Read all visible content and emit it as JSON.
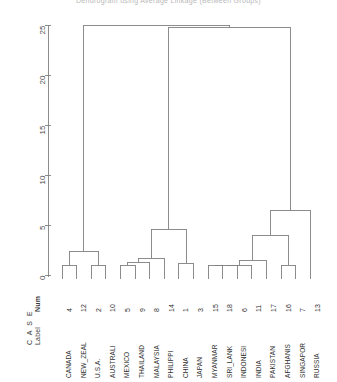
{
  "title": "Dendrogram using Average Linkage (Between Groups)",
  "axis": {
    "ticks": [
      "0",
      "5",
      "10",
      "15",
      "20",
      "25"
    ],
    "min": 0,
    "max": 25
  },
  "headers": {
    "case": "C A S E",
    "label": "Label",
    "num": "Num"
  },
  "leaves": [
    {
      "label": "CANADA",
      "num": "4"
    },
    {
      "label": "NEW_ZEAL",
      "num": "12"
    },
    {
      "label": "U.S.A.",
      "num": "2"
    },
    {
      "label": "AUSTRALI",
      "num": "10"
    },
    {
      "label": "MEXICO",
      "num": "5"
    },
    {
      "label": "THAILAND",
      "num": "9"
    },
    {
      "label": "MALAYSIA",
      "num": "8"
    },
    {
      "label": "PHILIPPI",
      "num": "14"
    },
    {
      "label": "CHINA",
      "num": "1"
    },
    {
      "label": "JAPAN",
      "num": "3"
    },
    {
      "label": "MYANMAR",
      "num": "15"
    },
    {
      "label": "SRI_LANK",
      "num": "18"
    },
    {
      "label": "INDONESI",
      "num": "6"
    },
    {
      "label": "INDIA",
      "num": "11"
    },
    {
      "label": "PAKISTAN",
      "num": "17"
    },
    {
      "label": "AFGHANIS",
      "num": "16"
    },
    {
      "label": "SINGAPOR",
      "num": "7"
    },
    {
      "label": "RUSSIA",
      "num": "13"
    }
  ],
  "chart_data": {
    "type": "dendrogram",
    "title": "Dendrogram using Average Linkage (Between Groups)",
    "xlabel": "Rescaled Distance Cluster Combine",
    "ylabel": "",
    "orientation": "vertical-leaves-bottom",
    "axis_range": [
      0,
      25
    ],
    "axis_ticks": [
      0,
      5,
      10,
      15,
      20,
      25
    ],
    "grid": false,
    "leaf_order": [
      "CANADA",
      "NEW_ZEAL",
      "U.S.A.",
      "AUSTRALI",
      "MEXICO",
      "THAILAND",
      "MALAYSIA",
      "PHILIPPI",
      "CHINA",
      "JAPAN",
      "MYANMAR",
      "SRI_LANK",
      "INDONESI",
      "INDIA",
      "PAKISTAN",
      "AFGHANIS",
      "SINGAPOR",
      "RUSSIA"
    ],
    "leaf_numbers": [
      4,
      12,
      2,
      10,
      5,
      9,
      8,
      14,
      1,
      3,
      15,
      18,
      6,
      11,
      17,
      16,
      7,
      13
    ],
    "merges": [
      {
        "id": "m1",
        "children": [
          "CANADA",
          "NEW_ZEAL"
        ],
        "height": 1.0
      },
      {
        "id": "m2",
        "children": [
          "U.S.A.",
          "AUSTRALI"
        ],
        "height": 1.0
      },
      {
        "id": "m3",
        "children": [
          "m1",
          "m2"
        ],
        "height": 2.4
      },
      {
        "id": "m4",
        "children": [
          "MEXICO",
          "THAILAND"
        ],
        "height": 1.0
      },
      {
        "id": "m5",
        "children": [
          "m4",
          "MALAYSIA"
        ],
        "height": 1.3
      },
      {
        "id": "m6",
        "children": [
          "m5",
          "PHILIPPI"
        ],
        "height": 1.7
      },
      {
        "id": "m7",
        "children": [
          "CHINA",
          "JAPAN"
        ],
        "height": 1.2
      },
      {
        "id": "m8",
        "children": [
          "m6",
          "m7"
        ],
        "height": 4.6
      },
      {
        "id": "m9",
        "children": [
          "MYANMAR",
          "SRI_LANK"
        ],
        "height": 1.0
      },
      {
        "id": "m10",
        "children": [
          "m9",
          "INDONESI"
        ],
        "height": 1.0
      },
      {
        "id": "m11",
        "children": [
          "m10",
          "INDIA"
        ],
        "height": 1.0
      },
      {
        "id": "m12",
        "children": [
          "m11",
          "PAKISTAN"
        ],
        "height": 1.5
      },
      {
        "id": "m13",
        "children": [
          "AFGHANIS",
          "SINGAPOR"
        ],
        "height": 1.0
      },
      {
        "id": "m14",
        "children": [
          "m12",
          "m13"
        ],
        "height": 4.0
      },
      {
        "id": "m15",
        "children": [
          "m14",
          "RUSSIA"
        ],
        "height": 6.5
      },
      {
        "id": "m16",
        "children": [
          "m8",
          "m15"
        ],
        "height": 24.8
      },
      {
        "id": "m17",
        "children": [
          "m3",
          "m16"
        ],
        "height": 25.0
      }
    ]
  },
  "colors": {
    "line": "#808080",
    "text": "#2e2e2e",
    "title": "#b8b8b8",
    "background": "#ffffff"
  }
}
